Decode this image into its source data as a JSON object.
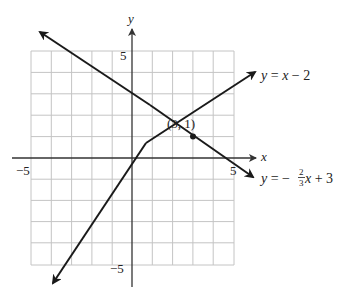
{
  "figure": {
    "type": "linear-system-graph",
    "axes": {
      "x_label": "x",
      "y_label": "y",
      "x_range": [
        -5,
        5
      ],
      "y_range": [
        -5,
        5
      ],
      "grid": true,
      "grid_step": 1,
      "tick_labels": {
        "x_neg": "−5",
        "x_pos": "5",
        "y_pos": "5",
        "y_neg": "−5"
      }
    },
    "lines": [
      {
        "name": "line-1",
        "equation": "y = x − 2",
        "slope": 1,
        "intercept": -2,
        "label_parts": {
          "y": "y",
          "eq": " = ",
          "x": "x",
          "rest": " − 2"
        }
      },
      {
        "name": "line-2",
        "equation": "y = −(2/3)x + 3",
        "slope": -0.6667,
        "intercept": 3,
        "label_parts": {
          "y": "y",
          "eq": " = −",
          "num": "2",
          "den": "3",
          "x": "x",
          "rest": " + 3"
        }
      }
    ],
    "intersection": {
      "x": 3,
      "y": 1,
      "label": "(3, 1)"
    },
    "colors": {
      "line": "#1a1a1a",
      "grid": "#bdbdbd",
      "axis": "#333333"
    }
  }
}
